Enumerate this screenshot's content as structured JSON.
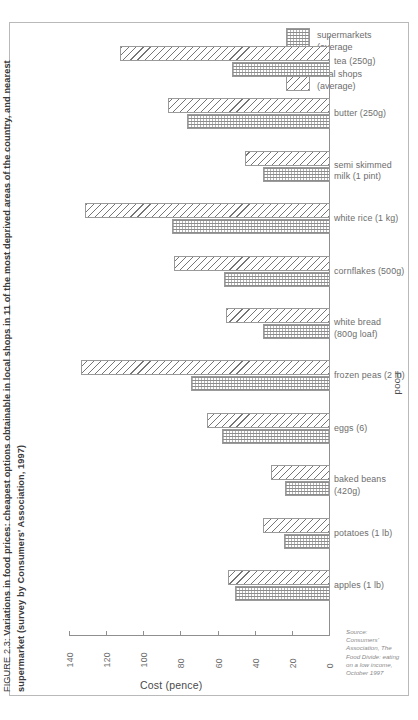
{
  "figure": {
    "number": "FIGURE 2.3:",
    "caption": "Variations in food prices: cheapest options obtainable in local shops in 11 of the most deprived areas of the country, and nearest supermarket (survey by Consumers' Association, 1997)"
  },
  "legend": {
    "position": "top-right",
    "items": [
      {
        "key": "supermarkets",
        "label": "supermarkets\n(average"
      },
      {
        "key": "local-shops",
        "label": "local shops\n(average)"
      }
    ]
  },
  "source": {
    "text": "Source:\nConsumers'\nAssociation, The\nFood Divide: eating\non a low income,\nOctober 1997"
  },
  "axes": {
    "x_title": "Cost (pence)",
    "y_title": "Food",
    "x_ticks": [
      "140",
      "120",
      "100",
      "80",
      "60",
      "40",
      "20",
      "0"
    ]
  },
  "chart_data": {
    "type": "bar",
    "orientation": "horizontal",
    "title": "Variations in food prices: cheapest options obtainable in local shops in 11 of the most deprived areas of the country, and nearest supermarket (survey by Consumers' Association, 1997)",
    "xlabel": "Cost (pence)",
    "ylabel": "Food",
    "xlim": [
      140,
      0
    ],
    "x_reversed": true,
    "grid": false,
    "legend_position": "top-right",
    "categories": [
      "tea (250g)",
      "butter (250g)",
      "semi skimmed\nmilk (1 pint)",
      "white rice (1 kg)",
      "cornflakes (500g)",
      "white bread\n(800g loaf)",
      "frozen peas (2 lb)",
      "eggs (6)",
      "baked beans\n(420g)",
      "potatoes (1 lb)",
      "apples (1 lb)"
    ],
    "series": [
      {
        "name": "local shops (average)",
        "values": [
          113,
          87,
          46,
          132,
          84,
          56,
          134,
          66,
          32,
          36,
          55
        ]
      },
      {
        "name": "supermarkets (average)",
        "values": [
          53,
          77,
          36,
          85,
          57,
          36,
          75,
          58,
          24,
          25,
          51
        ]
      }
    ]
  }
}
